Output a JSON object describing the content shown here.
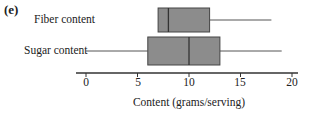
{
  "panel_label": "(e)",
  "chart_data": {
    "type": "boxplot",
    "title": "",
    "xlabel": "Content (grams/serving)",
    "ylabel": "",
    "xlim": [
      0,
      20
    ],
    "xticks": [
      0,
      5,
      10,
      15,
      20
    ],
    "orientation": "horizontal",
    "grid": false,
    "series": [
      {
        "name": "Fiber content",
        "min": 7,
        "q1": 7,
        "median": 8,
        "q3": 12,
        "max": 18
      },
      {
        "name": "Sugar content",
        "min": 0,
        "q1": 6,
        "median": 10,
        "q3": 13,
        "max": 19
      }
    ],
    "box_color": "#8c8c8c"
  },
  "labels": {
    "fiber": "Fiber content",
    "sugar": "Sugar content",
    "tick0": "0",
    "tick5": "5",
    "tick10": "10",
    "tick15": "15",
    "tick20": "20"
  }
}
